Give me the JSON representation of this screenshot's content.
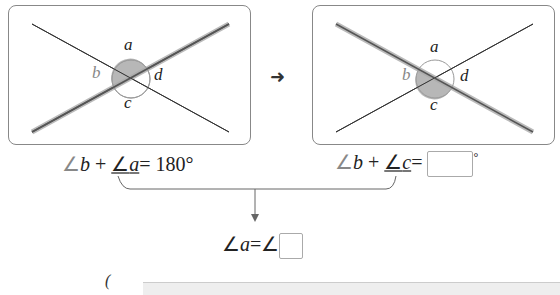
{
  "panels": [
    {
      "labels": {
        "a": "a",
        "b": "b",
        "c": "c",
        "d": "d"
      },
      "shaded": "a-b",
      "highlighted_line": "rising"
    },
    {
      "labels": {
        "a": "a",
        "b": "b",
        "c": "c",
        "d": "d"
      },
      "shaded": "b-c",
      "highlighted_line": "falling"
    }
  ],
  "arrow_icon": "right-arrow-icon",
  "equations": {
    "left": {
      "angle_sym": "∠",
      "var1": "b",
      "plus": "+",
      "var2": "a",
      "equals": "=",
      "value": "180°"
    },
    "right": {
      "angle_sym": "∠",
      "var1": "b",
      "plus": "+",
      "var2": "c",
      "equals": "=",
      "blank": "",
      "degree": "°"
    },
    "result": {
      "angle_sym": "∠",
      "var1": "a",
      "equals": "=",
      "angle_sym2": "∠",
      "blank": ""
    }
  },
  "bottom": {
    "paren": "("
  }
}
